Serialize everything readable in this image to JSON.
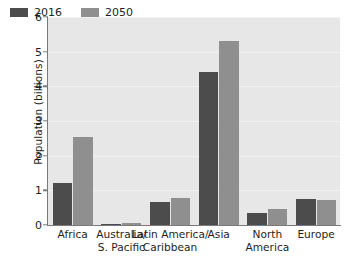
{
  "chart_data": {
    "type": "bar",
    "title": "",
    "xlabel": "",
    "ylabel": "Population (billions)",
    "ylim": [
      0,
      6
    ],
    "yticks": [
      0,
      1,
      2,
      3,
      4,
      5,
      6
    ],
    "ytick_labels": [
      "0",
      "1",
      "2",
      "3",
      "4",
      "5",
      "6"
    ],
    "grid": true,
    "grid_axis": "y",
    "legend_position": "upper left (inside plot)",
    "categories": [
      "Africa",
      "Australia/ S. Pacific",
      "Latin America/ Caribbean",
      "Asia",
      "North America",
      "Europe"
    ],
    "category_lines": [
      [
        "Africa",
        ""
      ],
      [
        "Australia/",
        "S. Pacific"
      ],
      [
        "Latin America/",
        "Caribbean"
      ],
      [
        "Asia",
        ""
      ],
      [
        "North",
        "America"
      ],
      [
        "Europe",
        ""
      ]
    ],
    "series": [
      {
        "name": "2016",
        "color": "#4c4c4c",
        "values": [
          1.22,
          0.04,
          0.65,
          4.42,
          0.36,
          0.74
        ]
      },
      {
        "name": "2050",
        "color": "#8f8f8f",
        "values": [
          2.53,
          0.06,
          0.78,
          5.3,
          0.45,
          0.72
        ]
      }
    ]
  },
  "legend": {
    "items": [
      {
        "label": "2016",
        "color": "#4c4c4c"
      },
      {
        "label": "2050",
        "color": "#8f8f8f"
      }
    ]
  },
  "style": {
    "plot_background": "#e7e7e7",
    "gridline_color": "#f2f2f2",
    "axis_color": "#7a7a7a",
    "text_color": "#231f20",
    "figure_background": "#ffffff"
  }
}
